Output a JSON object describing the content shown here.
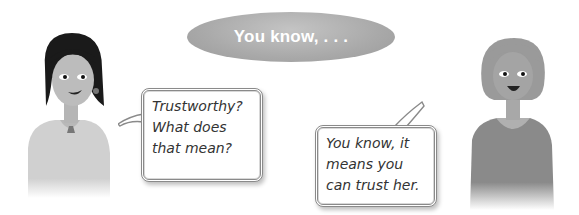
{
  "title_bubble": {
    "text": "You know, . . ."
  },
  "speech_left": {
    "speaker": "girl-dark-hair",
    "lines": [
      "Trustworthy?",
      "What does",
      "that mean?"
    ]
  },
  "speech_right": {
    "speaker": "girl-light-hair",
    "lines": [
      "You know, it",
      "means you",
      "can trust her."
    ]
  },
  "colors": {
    "title_bubble": "#a9a9a9",
    "bubble_border": "#8a8a8a",
    "text": "#333333"
  }
}
